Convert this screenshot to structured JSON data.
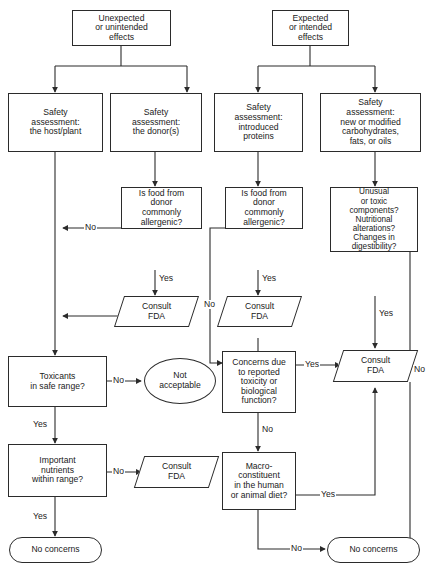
{
  "diagram": {
    "line_color": "#2b2b2b",
    "text_color": "#1a1a1a",
    "background": "#ffffff"
  },
  "nodes": {
    "unexpected_effects": "Unexpected\nor unintended\neffects",
    "expected_effects": "Expected\nor intended\neffects",
    "sa_host_plant": "Safety\nassessment:\nthe host/plant",
    "sa_donors": "Safety\nassessment:\nthe donor(s)",
    "sa_introduced_proteins": "Safety\nassessment:\nintroduced\nproteins",
    "sa_carbohydrates": "Safety\nassessment:\nnew or modified\ncarbohydrates,\nfats, or oils",
    "allergenic_left": "Is food from\ndonor\ncommonly\nallergenic?",
    "allergenic_right": "Is food from\ndonor\ncommonly\nallergenic?",
    "unusual_toxic": "Unusual\nor toxic\ncomponents?\nNutritional\nalterations?\nChanges in\ndigestibility?",
    "consult_fda_1": "Consult\nFDA",
    "consult_fda_2": "Consult\nFDA",
    "consult_fda_3": "Consult\nFDA",
    "consult_fda_4": "Consult\nFDA",
    "toxicants": "Toxicants\nin safe range?",
    "not_acceptable": "Not\nacceptable",
    "concerns_due": "Concerns due\nto reported\ntoxicity or\nbiological\nfunction?",
    "important_nutrients": "Important\nnutrients\nwithin range?",
    "macro_constituent": "Macro-\nconstituent\nin the human\nor animal diet?",
    "no_concerns_left": "No concerns",
    "no_concerns_right": "No concerns"
  },
  "edge_labels": {
    "allergenic_left_no": "No",
    "allergenic_left_yes": "Yes",
    "allergenic_right_no": "No",
    "allergenic_right_yes": "Yes",
    "unusual_yes": "Yes",
    "unusual_no": "No",
    "toxicants_no": "No",
    "toxicants_yes": "Yes",
    "concerns_yes": "Yes",
    "concerns_no": "No",
    "nutrients_no": "No",
    "nutrients_yes": "Yes",
    "macro_yes": "Yes",
    "macro_no": "No"
  }
}
